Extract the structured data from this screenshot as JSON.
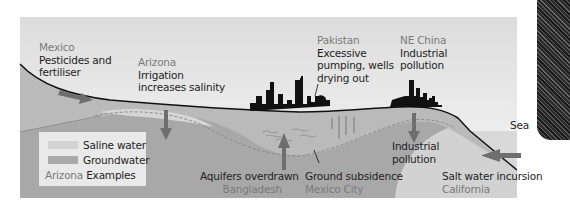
{
  "colors": {
    "sky_top": "#dedede",
    "sky_bottom": "#f7f7f7",
    "ground": "#bdbdbd",
    "groundwater": "#a9a9a9",
    "saline_water": "#d3d3d3",
    "sea": "#d8d8d8",
    "arrow": "#707070",
    "land_line": "#111111",
    "skyline": "#111111",
    "place_text": "#7a7a7a"
  },
  "labels": {
    "mexico": {
      "place": "Mexico",
      "line1": "Pesticides and",
      "line2": "fertiliser"
    },
    "arizona": {
      "place": "Arizona",
      "line1": "Irrigation",
      "line2": "increases salinity"
    },
    "pakistan": {
      "place": "Pakistan",
      "line1": "Excessive",
      "line2": "pumping, wells",
      "line3": "drying out"
    },
    "ne_china": {
      "place": "NE China",
      "line1": "Industrial",
      "line2": "pollution"
    },
    "sea": "Sea",
    "industrial": {
      "line1": "Industrial",
      "line2": "pollution"
    },
    "bangladesh": {
      "issue": "Aquifers overdrawn",
      "place": "Bangladesh"
    },
    "mexico_city": {
      "issue": "Ground subsidence",
      "place": "Mexico City"
    },
    "california": {
      "issue": "Salt water incursion",
      "place": "California"
    }
  },
  "legend": {
    "items": [
      {
        "label": "Saline water",
        "color": "#d3d3d3"
      },
      {
        "label": "Groundwater",
        "color": "#a9a9a9"
      }
    ],
    "key_place": "Arizona",
    "key_text": "Examples"
  }
}
